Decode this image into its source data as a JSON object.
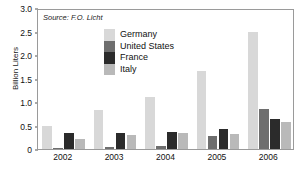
{
  "chart_data": {
    "type": "bar",
    "title": "",
    "subtitle": "",
    "source_note": "Source: F.O. Licht",
    "xlabel": "",
    "ylabel": "Billion Liters",
    "categories": [
      "2002",
      "2003",
      "2004",
      "2005",
      "2006"
    ],
    "series": [
      {
        "name": "Germany",
        "color": "#d8d8d8",
        "values": [
          0.5,
          0.84,
          1.11,
          1.65,
          2.5
        ]
      },
      {
        "name": "United States",
        "color": "#6e6e6e",
        "values": [
          0.02,
          0.04,
          0.06,
          0.27,
          0.86
        ]
      },
      {
        "name": "France",
        "color": "#2b2b2b",
        "values": [
          0.35,
          0.35,
          0.36,
          0.42,
          0.63
        ]
      },
      {
        "name": "Italy",
        "color": "#b9b9b9",
        "values": [
          0.21,
          0.29,
          0.34,
          0.33,
          0.57
        ]
      }
    ],
    "ylim": [
      0,
      3.0
    ],
    "yticks": [
      "0",
      "0.5",
      "1.0",
      "1.5",
      "2.0",
      "2.5",
      "3.0"
    ],
    "ytick_values": [
      0,
      0.5,
      1.0,
      1.5,
      2.0,
      2.5,
      3.0
    ],
    "grid": false,
    "legend_position": "inside-top-center",
    "frame_color": "#9a9a9a",
    "background_color": "#ffffff",
    "text_color": "#111111"
  },
  "legend": {
    "items": [
      {
        "label": "Germany"
      },
      {
        "label": "United States"
      },
      {
        "label": "France"
      },
      {
        "label": "Italy"
      }
    ]
  },
  "axes": {
    "y_title": "Billion Liters"
  }
}
